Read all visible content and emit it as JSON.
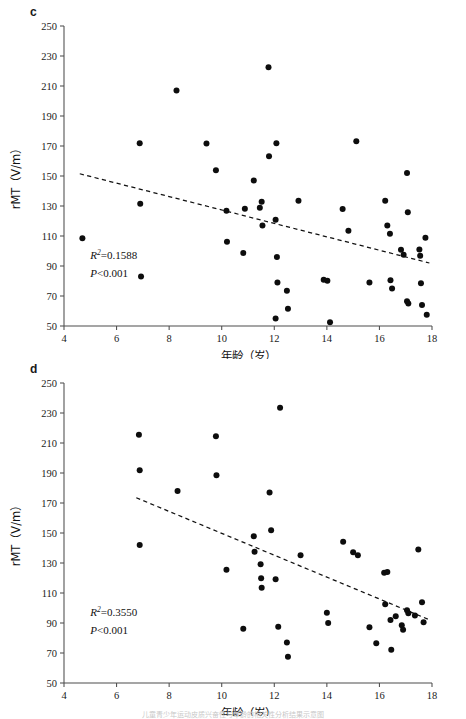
{
  "figure": {
    "background": "#ffffff",
    "dot_color": "#0d0d0d",
    "axis_color": "#4d4d4d",
    "bottom_caption": "儿童青少年运动皮质兴奋性与年龄的相关性分析结果示意图"
  },
  "panels": [
    {
      "id": "c",
      "label": "c",
      "chart_data": {
        "type": "scatter",
        "title": "",
        "xlabel": "年龄（岁）",
        "ylabel": "rMT（V/m）",
        "xlim": [
          4,
          18
        ],
        "ylim": [
          50,
          250
        ],
        "xticks": [
          4,
          6,
          8,
          10,
          12,
          14,
          16,
          18
        ],
        "xticklabels": [
          "4",
          "6",
          "8",
          "10",
          "12",
          "14",
          "16",
          "18"
        ],
        "yticks": [
          50,
          70,
          90,
          110,
          130,
          150,
          170,
          190,
          210,
          230,
          250
        ],
        "yticklabels": [
          "50",
          "70",
          "90",
          "110",
          "130",
          "150",
          "170",
          "190",
          "210",
          "230",
          "250"
        ],
        "grid": false,
        "legend": false,
        "annotations": [
          {
            "text": "R2=0.1588",
            "r_squared": 0.1588,
            "x": 5.0,
            "y": 95
          },
          {
            "text": "P<0.001",
            "p_value": "<0.001",
            "x": 5.0,
            "y": 83
          }
        ],
        "trendline": {
          "x": [
            4.6,
            17.9
          ],
          "y": [
            151.5,
            92.0
          ],
          "style": "dashed"
        },
        "points": [
          [
            4.7,
            108.5
          ],
          [
            6.88,
            171.8
          ],
          [
            6.9,
            131.5
          ],
          [
            6.93,
            83.0
          ],
          [
            8.28,
            207.0
          ],
          [
            9.42,
            171.6
          ],
          [
            9.78,
            153.8
          ],
          [
            10.18,
            126.8
          ],
          [
            10.2,
            106.2
          ],
          [
            10.82,
            98.6
          ],
          [
            10.88,
            128.2
          ],
          [
            11.22,
            147.0
          ],
          [
            11.45,
            128.8
          ],
          [
            11.52,
            132.8
          ],
          [
            11.55,
            117.0
          ],
          [
            11.78,
            222.5
          ],
          [
            11.8,
            163.2
          ],
          [
            12.05,
            120.8
          ],
          [
            12.08,
            171.8
          ],
          [
            12.1,
            96.0
          ],
          [
            12.12,
            79.0
          ],
          [
            12.05,
            55.0
          ],
          [
            12.48,
            73.5
          ],
          [
            12.52,
            61.5
          ],
          [
            12.92,
            133.5
          ],
          [
            13.88,
            80.8
          ],
          [
            14.02,
            80.2
          ],
          [
            14.12,
            52.5
          ],
          [
            14.6,
            128.0
          ],
          [
            14.82,
            113.5
          ],
          [
            15.12,
            173.2
          ],
          [
            15.62,
            79.0
          ],
          [
            16.22,
            133.5
          ],
          [
            16.3,
            117.0
          ],
          [
            16.4,
            111.5
          ],
          [
            16.42,
            80.5
          ],
          [
            16.48,
            75.0
          ],
          [
            16.82,
            100.8
          ],
          [
            16.92,
            97.5
          ],
          [
            17.05,
            152.0
          ],
          [
            17.08,
            125.8
          ],
          [
            17.05,
            66.5
          ],
          [
            17.1,
            65.0
          ],
          [
            17.52,
            101.0
          ],
          [
            17.55,
            96.8
          ],
          [
            17.58,
            78.5
          ],
          [
            17.62,
            64.0
          ],
          [
            17.75,
            108.8
          ],
          [
            17.8,
            57.5
          ]
        ]
      }
    },
    {
      "id": "d",
      "label": "d",
      "chart_data": {
        "type": "scatter",
        "title": "",
        "xlabel": "年龄（岁）",
        "ylabel": "rMT（V/m）",
        "xlim": [
          4,
          18
        ],
        "ylim": [
          50,
          250
        ],
        "xticks": [
          4,
          6,
          8,
          10,
          12,
          14,
          16,
          18
        ],
        "xticklabels": [
          "4",
          "6",
          "8",
          "10",
          "12",
          "14",
          "16",
          "18"
        ],
        "yticks": [
          50,
          70,
          90,
          110,
          130,
          150,
          170,
          190,
          210,
          230,
          250
        ],
        "yticklabels": [
          "50",
          "70",
          "90",
          "110",
          "130",
          "150",
          "170",
          "190",
          "210",
          "230",
          "250"
        ],
        "grid": false,
        "legend": false,
        "annotations": [
          {
            "text": "R2=0.3550",
            "r_squared": 0.355,
            "x": 5.0,
            "y": 95
          },
          {
            "text": "P<0.001",
            "p_value": "<0.001",
            "x": 5.0,
            "y": 83
          }
        ],
        "trendline": {
          "x": [
            6.75,
            17.85
          ],
          "y": [
            173.5,
            92.5
          ],
          "style": "dashed"
        },
        "points": [
          [
            6.85,
            215.5
          ],
          [
            6.88,
            191.8
          ],
          [
            6.88,
            142.0
          ],
          [
            8.32,
            178.0
          ],
          [
            9.78,
            214.5
          ],
          [
            9.8,
            188.5
          ],
          [
            10.18,
            125.5
          ],
          [
            10.82,
            86.2
          ],
          [
            11.22,
            147.8
          ],
          [
            11.25,
            137.5
          ],
          [
            11.48,
            129.2
          ],
          [
            11.5,
            119.8
          ],
          [
            11.52,
            113.5
          ],
          [
            11.82,
            177.0
          ],
          [
            11.88,
            151.8
          ],
          [
            12.05,
            119.2
          ],
          [
            12.22,
            233.5
          ],
          [
            12.15,
            87.5
          ],
          [
            12.48,
            77.0
          ],
          [
            12.52,
            67.5
          ],
          [
            13.0,
            135.2
          ],
          [
            14.0,
            96.8
          ],
          [
            14.05,
            90.0
          ],
          [
            14.62,
            144.2
          ],
          [
            15.0,
            137.2
          ],
          [
            15.18,
            135.2
          ],
          [
            15.62,
            87.2
          ],
          [
            15.88,
            76.5
          ],
          [
            16.18,
            123.5
          ],
          [
            16.22,
            102.5
          ],
          [
            16.3,
            124.0
          ],
          [
            16.42,
            92.0
          ],
          [
            16.45,
            72.2
          ],
          [
            16.62,
            94.5
          ],
          [
            16.85,
            88.5
          ],
          [
            16.9,
            85.5
          ],
          [
            17.05,
            98.5
          ],
          [
            17.1,
            96.5
          ],
          [
            17.35,
            95.0
          ],
          [
            17.48,
            139.0
          ],
          [
            17.62,
            103.8
          ],
          [
            17.68,
            90.5
          ]
        ]
      }
    }
  ]
}
